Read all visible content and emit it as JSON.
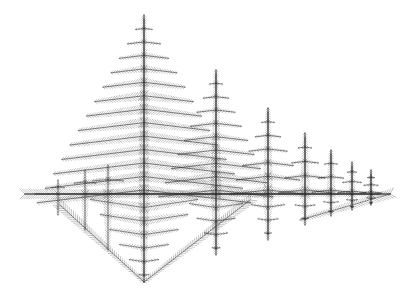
{
  "image": {
    "subject": "fractal fern-tree pattern",
    "background": "#ffffff",
    "ink": "#2a2a2a",
    "width": 410,
    "height": 298,
    "horizontal_axis": {
      "y": 194,
      "x_start": 25,
      "x_end": 390
    },
    "trees": [
      {
        "x": 144,
        "top": 15,
        "bottom": 282,
        "half_width": 115
      },
      {
        "x": 216,
        "top": 70,
        "bottom": 255,
        "half_width": 62
      },
      {
        "x": 268,
        "top": 108,
        "bottom": 240,
        "half_width": 42
      },
      {
        "x": 305,
        "top": 133,
        "bottom": 225,
        "half_width": 30
      },
      {
        "x": 331,
        "top": 150,
        "bottom": 216,
        "half_width": 22
      },
      {
        "x": 352,
        "top": 162,
        "bottom": 210,
        "half_width": 16
      },
      {
        "x": 371,
        "top": 170,
        "bottom": 205,
        "half_width": 12
      }
    ],
    "left_spurs": [
      {
        "x": 58,
        "top": 180,
        "bottom": 215
      },
      {
        "x": 85,
        "top": 170,
        "bottom": 230
      },
      {
        "x": 108,
        "top": 165,
        "bottom": 250
      }
    ]
  }
}
